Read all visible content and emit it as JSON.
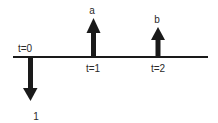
{
  "diagram": {
    "type": "cash-flow-timeline",
    "axis": {
      "color": "#1a1a1a"
    },
    "arrow_color": "#1a1a1a",
    "time_labels": [
      {
        "id": "t0",
        "text": "t=0"
      },
      {
        "id": "t1",
        "text": "t=1"
      },
      {
        "id": "t2",
        "text": "t=2"
      }
    ],
    "flows": [
      {
        "time": "t=0",
        "direction": "down",
        "label": "1"
      },
      {
        "time": "t=1",
        "direction": "up",
        "label": "a"
      },
      {
        "time": "t=2",
        "direction": "up",
        "label": "b"
      }
    ]
  }
}
